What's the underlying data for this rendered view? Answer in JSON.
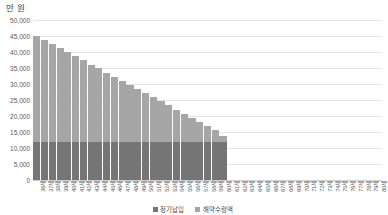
{
  "chart_data": {
    "type": "bar",
    "stacked": true,
    "title": "",
    "subtitle": "",
    "xlabel": "",
    "ylabel": "만 원",
    "ylim": [
      0,
      50000
    ],
    "ytick_labels": [
      "50,000",
      "45,000",
      "40,000",
      "35,000",
      "30,000",
      "25,000",
      "20,000",
      "15,000",
      "10,000",
      "5,000",
      "0"
    ],
    "ytick_values": [
      50000,
      45000,
      40000,
      35000,
      30000,
      25000,
      20000,
      15000,
      10000,
      5000,
      0
    ],
    "grid": true,
    "legend_position": "bottom",
    "categories": [
      "36세",
      "37세",
      "38세",
      "39세",
      "40세",
      "41세",
      "42세",
      "43세",
      "44세",
      "45세",
      "46세",
      "47세",
      "48세",
      "49세",
      "50세",
      "51세",
      "52세",
      "53세",
      "54세",
      "55세",
      "56세",
      "57세",
      "58세",
      "59세",
      "60세",
      "61세",
      "62세",
      "63세",
      "64세",
      "65세",
      "66세",
      "67세",
      "68세",
      "69세",
      "70세",
      "71세",
      "72세",
      "73세",
      "74세",
      "75세",
      "76세",
      "77세",
      "78세",
      "79세",
      "80세"
    ],
    "series": [
      {
        "name": "정기납입",
        "color": "#757575",
        "values": [
          11800,
          11800,
          11800,
          11800,
          11800,
          11800,
          11800,
          11800,
          11800,
          11800,
          11800,
          11800,
          11800,
          11800,
          11800,
          11800,
          11800,
          11800,
          11800,
          11800,
          11800,
          11800,
          11800,
          11800,
          11800,
          0,
          0,
          0,
          0,
          0,
          0,
          0,
          0,
          0,
          0,
          0,
          0,
          0,
          0,
          0,
          0,
          0,
          0,
          0,
          0
        ]
      },
      {
        "name": "해약수령액",
        "color": "#a6a6a6",
        "values": [
          33300,
          32100,
          30800,
          29500,
          28200,
          26900,
          25600,
          24300,
          23100,
          21800,
          20500,
          19200,
          17900,
          16600,
          15400,
          14100,
          12800,
          11500,
          10200,
          8900,
          7700,
          6400,
          5100,
          3800,
          2000,
          0,
          0,
          0,
          0,
          0,
          0,
          0,
          0,
          0,
          0,
          0,
          0,
          0,
          0,
          0,
          0,
          0,
          0,
          0,
          0
        ]
      }
    ],
    "totals": [
      45100,
      43900,
      42600,
      41300,
      40000,
      38700,
      37400,
      36100,
      34900,
      33600,
      32300,
      31000,
      29700,
      28400,
      27200,
      25900,
      24600,
      23300,
      22000,
      20700,
      19500,
      18200,
      16900,
      15600,
      13800,
      0,
      0,
      0,
      0,
      0,
      0,
      0,
      0,
      0,
      0,
      0,
      0,
      0,
      0,
      0,
      0,
      0,
      0,
      0,
      0
    ]
  },
  "legend": {
    "items": [
      {
        "label": "정기납입",
        "color": "#757575"
      },
      {
        "label": "해약수령액",
        "color": "#a6a6a6"
      }
    ]
  }
}
